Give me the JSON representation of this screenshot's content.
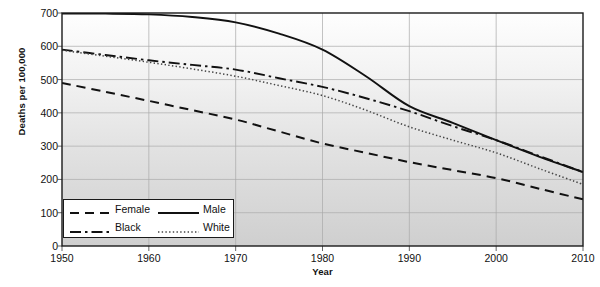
{
  "chart_data": {
    "type": "line",
    "title": "",
    "xlabel": "Year",
    "ylabel": "Deaths per 100,000",
    "xlim": [
      1950,
      2010
    ],
    "ylim": [
      0,
      700
    ],
    "xticks": [
      "1950",
      "1960",
      "1970",
      "1980",
      "1990",
      "2000",
      "2010"
    ],
    "yticks": [
      "0",
      "100",
      "200",
      "300",
      "400",
      "500",
      "600",
      "700"
    ],
    "grid": "both",
    "legend_position": "lower-left-inside",
    "x": [
      1950,
      1955,
      1960,
      1965,
      1970,
      1975,
      1980,
      1985,
      1990,
      1995,
      2000,
      2005,
      2010
    ],
    "series": [
      {
        "name": "Male",
        "style": "solid",
        "color": "#111111",
        "values": [
          698,
          698,
          696,
          688,
          672,
          638,
          590,
          510,
          420,
          370,
          318,
          268,
          222
        ]
      },
      {
        "name": "Black",
        "style": "dash-dot",
        "color": "#111111",
        "values": [
          590,
          574,
          558,
          544,
          530,
          504,
          478,
          444,
          405,
          360,
          318,
          270,
          222
        ]
      },
      {
        "name": "White",
        "style": "dotted",
        "color": "#444444",
        "values": [
          588,
          570,
          552,
          532,
          510,
          482,
          452,
          408,
          358,
          318,
          280,
          232,
          185
        ]
      },
      {
        "name": "Female",
        "style": "dashed",
        "color": "#111111",
        "values": [
          490,
          463,
          436,
          408,
          380,
          344,
          308,
          280,
          252,
          228,
          204,
          172,
          140
        ]
      }
    ]
  },
  "legend": {
    "entries": [
      {
        "label": "Female",
        "style": "dashed"
      },
      {
        "label": "Male",
        "style": "solid"
      },
      {
        "label": "Black",
        "style": "dash-dot"
      },
      {
        "label": "White",
        "style": "dotted"
      }
    ]
  }
}
